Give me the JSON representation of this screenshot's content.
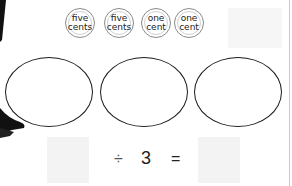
{
  "coins": [
    {
      "label": "five\ncents",
      "value": "five cents"
    },
    {
      "label": "five\ncents",
      "value": "five cents"
    },
    {
      "label": "one\ncent",
      "value": "one cent"
    },
    {
      "label": "one\ncent",
      "value": "one cent"
    }
  ],
  "equation": {
    "operator": "÷",
    "divisor": "3",
    "equals": "="
  },
  "groups_count": 3
}
